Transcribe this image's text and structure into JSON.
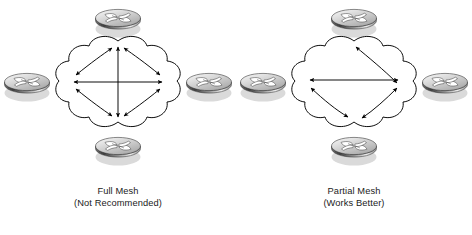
{
  "figure": {
    "type": "network-topology-diagram",
    "background_color": "#ffffff",
    "line_color": "#000000",
    "text_color": "#1b1b1b",
    "router_icon_name": "cisco-router-icon",
    "router_colors": {
      "top_face_light": "#f2f2f2",
      "top_face_mid": "#b9b9b9",
      "body_dark": "#4a4a4a",
      "body_light": "#e8e8e8",
      "outline": "#3a3a3a"
    }
  },
  "panels": [
    {
      "id": "full-mesh",
      "caption_line1": "Full Mesh",
      "caption_line2": "(Not Recommended)",
      "routers": [
        {
          "position": "top",
          "label": ""
        },
        {
          "position": "left",
          "label": ""
        },
        {
          "position": "right",
          "label": ""
        },
        {
          "position": "bottom",
          "label": ""
        }
      ],
      "links": [
        {
          "from": "left",
          "to": "right",
          "style": "straight",
          "arrows": "both"
        },
        {
          "from": "top",
          "to": "bottom",
          "style": "straight",
          "arrows": "both"
        },
        {
          "from": "left",
          "to": "top",
          "style": "curved",
          "arrows": "both"
        },
        {
          "from": "top",
          "to": "right",
          "style": "curved",
          "arrows": "both"
        },
        {
          "from": "left",
          "to": "bottom",
          "style": "curved",
          "arrows": "both"
        },
        {
          "from": "bottom",
          "to": "right",
          "style": "curved",
          "arrows": "both"
        }
      ],
      "link_count": 6,
      "arrowheads_per_node": 3
    },
    {
      "id": "partial-mesh",
      "caption_line1": "Partial Mesh",
      "caption_line2": "(Works Better)",
      "routers": [
        {
          "position": "top",
          "label": ""
        },
        {
          "position": "left",
          "label": ""
        },
        {
          "position": "right",
          "label": ""
        },
        {
          "position": "bottom",
          "label": ""
        }
      ],
      "links": [
        {
          "from": "left",
          "to": "right",
          "style": "straight",
          "arrows": "both"
        },
        {
          "from": "top",
          "to": "right",
          "style": "curved",
          "arrows": "both"
        },
        {
          "from": "left",
          "to": "bottom",
          "style": "curved",
          "arrows": "both"
        },
        {
          "from": "bottom",
          "to": "right",
          "style": "curved",
          "arrows": "both"
        }
      ],
      "link_count": 4,
      "arrowheads_per_node": 2
    }
  ]
}
